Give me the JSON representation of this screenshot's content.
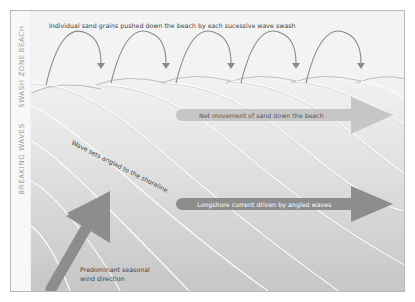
{
  "diagram": {
    "type": "longshore-drift-illustration",
    "zones": [
      {
        "label": "BEACH"
      },
      {
        "label": "SWASH ZONE"
      },
      {
        "label": "BREAKING WAVES"
      }
    ],
    "captions": {
      "swash": "Individual sand grains pushed down the beach by each sucessive wave swash",
      "net_movement": "Net movement of sand down the beach",
      "wave_sets": "Wave sets angled to the shoreline",
      "longshore": "Longshore current driven by angled waves",
      "wind_line1": "Predominant seasonal",
      "wind_line2": "wind direction"
    },
    "swash_arc_count": 5,
    "colors": {
      "frame_bg": "#f4f4f4",
      "sea_top": "#ececec",
      "sea_bottom": "#c9c9c9",
      "arc": "#8a8a8a",
      "net_arrow": "#c4c4c4",
      "longshore_arrow": "#8c8c8c",
      "wind_arrow": "#8c8c8c",
      "wave_line": "#ffffff"
    }
  }
}
